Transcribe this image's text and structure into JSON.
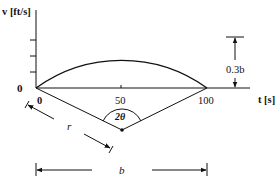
{
  "diagram": {
    "y_axis_label": "v [ft/s]",
    "x_axis_label": "t [s]",
    "origin_label": "0",
    "x_ticks": [
      "0",
      "50",
      "100"
    ],
    "angle_label": "2θ",
    "radius_label": "r",
    "height_label": "0.3b",
    "base_label": "b",
    "curve": {
      "type": "circular arc",
      "t_start": 0,
      "t_end": 100,
      "peak_t": 50,
      "peak_height": "0.3b"
    }
  }
}
